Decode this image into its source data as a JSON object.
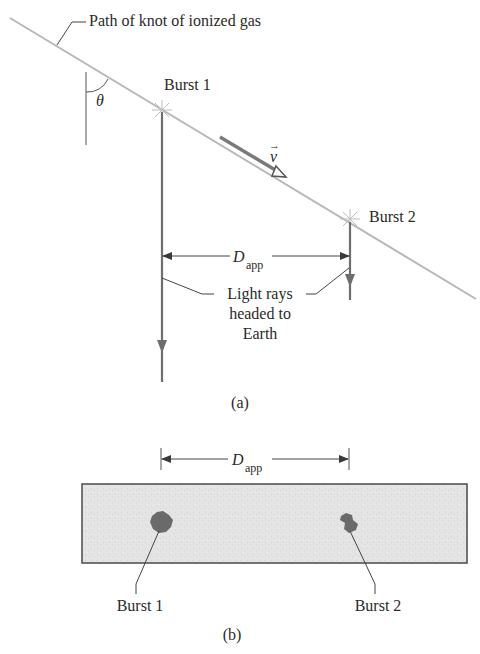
{
  "figure": {
    "panel_a": {
      "path_label": "Path of knot of ionized gas",
      "angle_label": "θ",
      "burst1_label": "Burst 1",
      "burst2_label": "Burst 2",
      "velocity_label": "v",
      "velocity_arrow": "→",
      "distance_label_main": "D",
      "distance_label_sub": "app",
      "light_rays_line1": "Light rays",
      "light_rays_line2": "headed to",
      "light_rays_line3": "Earth",
      "caption": "(a)"
    },
    "panel_b": {
      "distance_label_main": "D",
      "distance_label_sub": "app",
      "burst1_label": "Burst 1",
      "burst2_label": "Burst 2",
      "caption": "(b)"
    },
    "colors": {
      "path_line": "#b8b8b8",
      "ray": "#6e6e6e",
      "velocity": "#7a7a7a",
      "image_fill": "#e6e6e6",
      "image_border": "#4a4a4a",
      "blob": "#6a6a6a",
      "text": "#2a2a2a"
    }
  }
}
